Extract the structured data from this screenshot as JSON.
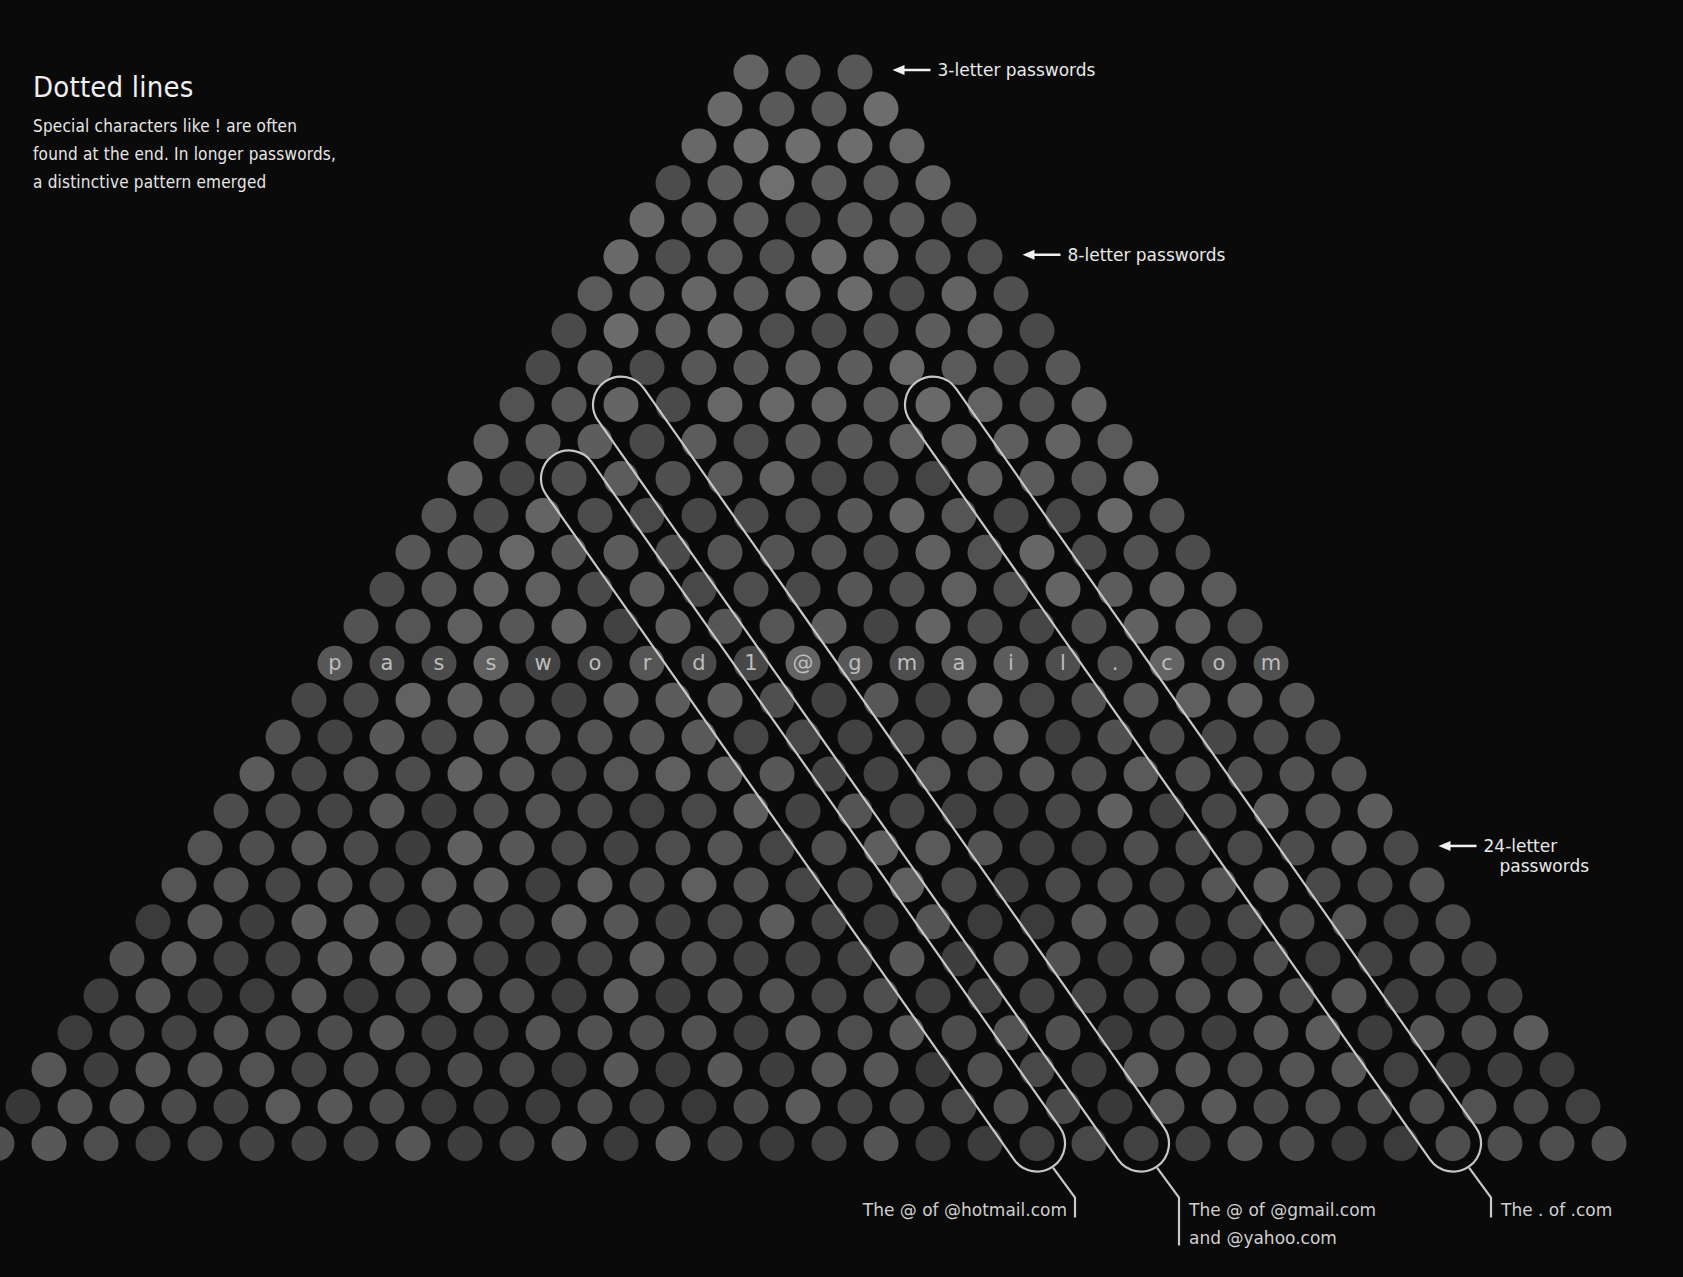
{
  "intro": {
    "title": "Dotted lines",
    "body_lines": [
      "Special characters like ! are often",
      "found at the end. In longer passwords,",
      "a distinctive pattern emerged"
    ]
  },
  "colors": {
    "background": "#0a0a0a",
    "dot_base": "#555555",
    "dot_light": "#6a6a6a",
    "dot_dark": "#3e3e3e",
    "outline": "#c8c8c8",
    "text": "#e8e8e8"
  },
  "chart_data": {
    "type": "dot-matrix",
    "title": "Dotted lines",
    "rows": {
      "min_length": 3,
      "max_length": 32,
      "count": 30
    },
    "geometry": {
      "apex_x": 803,
      "top_y": 72,
      "dx": 52,
      "dy": 36.95,
      "radius": 17.5
    },
    "example_row": {
      "length": 19,
      "characters": [
        "p",
        "a",
        "s",
        "s",
        "w",
        "o",
        "r",
        "d",
        "1",
        "@",
        "g",
        "m",
        "a",
        "i",
        "l",
        ".",
        "c",
        "o",
        "m"
      ],
      "text": "password1@gmail.com"
    },
    "row_annotations": [
      {
        "length": 3,
        "label": "3-letter passwords"
      },
      {
        "length": 8,
        "label": "8-letter passwords"
      },
      {
        "length": 24,
        "label_lines": [
          "24-letter",
          "passwords"
        ]
      }
    ],
    "diagonal_callouts": [
      {
        "id": "hotmail",
        "start_length": 14,
        "start_index": 2,
        "end_length": 32,
        "end_index": 20,
        "label_lines": [
          "The @ of @hotmail.com"
        ],
        "label_side": "left"
      },
      {
        "id": "gmail",
        "start_length": 12,
        "start_index": 2,
        "end_length": 32,
        "end_index": 22,
        "label_lines": [
          "The @ of @gmail.com",
          "and @yahoo.com"
        ],
        "label_side": "right"
      },
      {
        "id": "dotcom",
        "start_length": 12,
        "start_index": 8,
        "end_length": 32,
        "end_index": 28,
        "label_lines": [
          "The . of .com"
        ],
        "label_side": "right"
      }
    ]
  }
}
